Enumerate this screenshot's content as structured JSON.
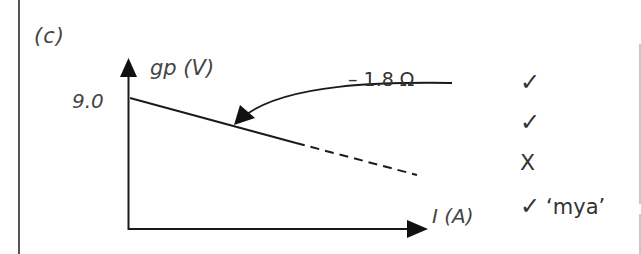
{
  "part": "(c)",
  "graph": {
    "y_axis_label": "gp (V)",
    "x_axis_label": "I  (A)",
    "y_intercept_label": "9.0",
    "gradient_annotation": "– 1.8 Ω",
    "line_style": {
      "solid_segment": "solid",
      "extrapolation": "dashed"
    },
    "line_color": "#1a1a1a"
  },
  "marks": [
    {
      "symbol": "✓",
      "note": ""
    },
    {
      "symbol": "✓",
      "note": ""
    },
    {
      "symbol": "X",
      "note": ""
    },
    {
      "symbol": "✓",
      "note": "‘mya’"
    }
  ]
}
